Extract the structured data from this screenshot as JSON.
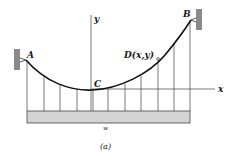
{
  "figure": {
    "caption": "(a)",
    "labels": {
      "A": "A",
      "B": "B",
      "C": "C",
      "D": "D(x,y)",
      "x_axis": "x",
      "y_axis": "y",
      "load": "w"
    },
    "colors": {
      "cable": "#111111",
      "wall": "#8a8a8a",
      "deck": "#d4d4d4",
      "line": "#555555"
    }
  }
}
